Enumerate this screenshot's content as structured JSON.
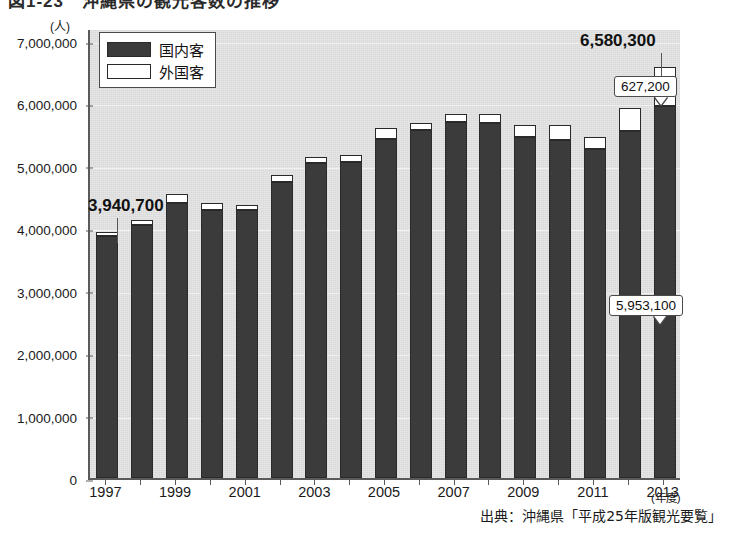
{
  "figure": {
    "title": "図1-23　沖縄県の観光客数の推移",
    "source_note": "出典：沖縄県「平成25年版観光要覧」",
    "y_unit": "(人)",
    "x_unit": "(年度)"
  },
  "legend": {
    "items": [
      {
        "key": "domestic",
        "label": "国内客",
        "color": "#3b3b3b"
      },
      {
        "key": "foreign",
        "label": "外国客",
        "color": "#ffffff"
      }
    ]
  },
  "annotations": [
    {
      "name": "annotation-1997-total",
      "text": "3,940,700",
      "style": "plain"
    },
    {
      "name": "annotation-2013-total",
      "text": "6,580,300",
      "style": "plain"
    },
    {
      "name": "annotation-2013-foreign",
      "text": "627,200",
      "style": "callout"
    },
    {
      "name": "annotation-2013-domestic",
      "text": "5,953,100",
      "style": "callout"
    }
  ],
  "chart_data": {
    "type": "bar",
    "subtype": "stacked-column",
    "title": "図1-23　沖縄県の観光客数の推移",
    "xlabel": "(年度)",
    "ylabel": "(人)",
    "ylim": [
      0,
      7000000
    ],
    "ytick_step": 1000000,
    "grid": true,
    "legend_position": "top-left",
    "categories": [
      "1997",
      "1998",
      "1999",
      "2000",
      "2001",
      "2002",
      "2003",
      "2004",
      "2005",
      "2006",
      "2007",
      "2008",
      "2009",
      "2010",
      "2011",
      "2012",
      "2013"
    ],
    "ytick_labels": [
      "0",
      "1,000,000",
      "2,000,000",
      "3,000,000",
      "4,000,000",
      "5,000,000",
      "6,000,000",
      "7,000,000"
    ],
    "xtick_labels": [
      "1997",
      "1999",
      "2001",
      "2003",
      "2005",
      "2007",
      "2009",
      "2011",
      "2013"
    ],
    "series": [
      {
        "name": "国内客",
        "key": "domestic",
        "color": "#3b3b3b",
        "values": [
          3870000,
          4050000,
          4400000,
          4300000,
          4290000,
          4740000,
          5040000,
          5060000,
          5430000,
          5580000,
          5700000,
          5690000,
          5470000,
          5420000,
          5270000,
          5560000,
          5953100
        ]
      },
      {
        "name": "外国客",
        "key": "foreign",
        "color": "#ffffff",
        "values": [
          70700,
          90000,
          150000,
          100000,
          80000,
          110000,
          100000,
          120000,
          170000,
          110000,
          130000,
          140000,
          190000,
          230000,
          190000,
          360000,
          627200
        ]
      }
    ],
    "totals": [
      3940700,
      4140000,
      4550000,
      4400000,
      4370000,
      4850000,
      5140000,
      5180000,
      5600000,
      5690000,
      5830000,
      5830000,
      5660000,
      5650000,
      5460000,
      5920000,
      6580300
    ],
    "labeled_points": [
      {
        "category": "1997",
        "label": "3,940,700",
        "refers_to": "total"
      },
      {
        "category": "2013",
        "label": "6,580,300",
        "refers_to": "total"
      },
      {
        "category": "2013",
        "label": "627,200",
        "refers_to": "外国客"
      },
      {
        "category": "2013",
        "label": "5,953,100",
        "refers_to": "国内客"
      }
    ]
  }
}
